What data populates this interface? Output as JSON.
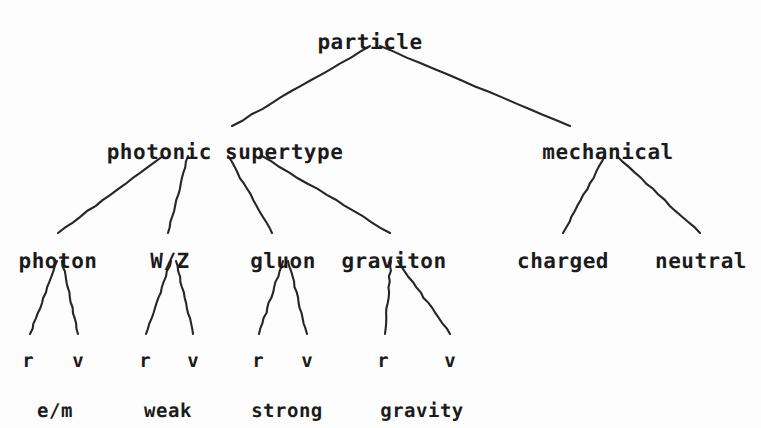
{
  "diagram": {
    "title": "particle",
    "background_color": "#fdfdfd",
    "text_color": "#1b1b1b",
    "line_color": "#262626"
  },
  "nodes": {
    "root": {
      "label": "particle",
      "x": 370,
      "y": 30
    },
    "level2": [
      {
        "label": "photonic supertype",
        "x": 225,
        "y": 140
      },
      {
        "label": "mechanical",
        "x": 608,
        "y": 140
      }
    ],
    "level3": [
      {
        "label": "photon",
        "x": 58,
        "y": 249
      },
      {
        "label": "W/Z",
        "x": 170,
        "y": 249
      },
      {
        "label": "gluon",
        "x": 283,
        "y": 249
      },
      {
        "label": "graviton",
        "x": 394,
        "y": 249
      },
      {
        "label": "charged",
        "x": 563,
        "y": 249
      },
      {
        "label": "neutral",
        "x": 701,
        "y": 249
      }
    ],
    "leaf_symbols": [
      {
        "label": "r",
        "x": 28,
        "y": 350
      },
      {
        "label": "v",
        "x": 78,
        "y": 350
      },
      {
        "label": "r",
        "x": 145,
        "y": 350
      },
      {
        "label": "v",
        "x": 193,
        "y": 350
      },
      {
        "label": "r",
        "x": 258,
        "y": 350
      },
      {
        "label": "v",
        "x": 307,
        "y": 350
      },
      {
        "label": "r",
        "x": 383,
        "y": 350
      },
      {
        "label": "v",
        "x": 450,
        "y": 350
      }
    ],
    "captions": [
      {
        "label": "e/m",
        "x": 55,
        "y": 400
      },
      {
        "label": "weak",
        "x": 168,
        "y": 400
      },
      {
        "label": "strong",
        "x": 287,
        "y": 400
      },
      {
        "label": "gravity",
        "x": 422,
        "y": 400
      }
    ]
  },
  "edges": [
    {
      "from": "particle",
      "to": "photonic supertype",
      "x1": 370,
      "y1": 46,
      "x2": 232,
      "y2": 126
    },
    {
      "from": "particle",
      "to": "mechanical",
      "x1": 380,
      "y1": 46,
      "x2": 570,
      "y2": 126
    },
    {
      "from": "photonic supertype",
      "to": "photon",
      "x1": 163,
      "y1": 156,
      "x2": 58,
      "y2": 233
    },
    {
      "from": "photonic supertype",
      "to": "W/Z",
      "x1": 188,
      "y1": 156,
      "x2": 168,
      "y2": 233
    },
    {
      "from": "photonic supertype",
      "to": "gluon",
      "x1": 228,
      "y1": 156,
      "x2": 272,
      "y2": 233
    },
    {
      "from": "photonic supertype",
      "to": "graviton",
      "x1": 262,
      "y1": 156,
      "x2": 390,
      "y2": 233
    },
    {
      "from": "mechanical",
      "to": "charged",
      "x1": 605,
      "y1": 156,
      "x2": 563,
      "y2": 233
    },
    {
      "from": "mechanical",
      "to": "neutral",
      "x1": 617,
      "y1": 156,
      "x2": 700,
      "y2": 233
    },
    {
      "from": "photon",
      "to": "r",
      "x1": 57,
      "y1": 261,
      "x2": 30,
      "y2": 334
    },
    {
      "from": "photon",
      "to": "v",
      "x1": 62,
      "y1": 261,
      "x2": 78,
      "y2": 334
    },
    {
      "from": "W/Z",
      "to": "r",
      "x1": 171,
      "y1": 261,
      "x2": 146,
      "y2": 334
    },
    {
      "from": "W/Z",
      "to": "v",
      "x1": 176,
      "y1": 261,
      "x2": 193,
      "y2": 334
    },
    {
      "from": "gluon",
      "to": "r",
      "x1": 283,
      "y1": 261,
      "x2": 259,
      "y2": 334
    },
    {
      "from": "gluon",
      "to": "v",
      "x1": 288,
      "y1": 261,
      "x2": 307,
      "y2": 334
    },
    {
      "from": "graviton",
      "to": "r",
      "x1": 391,
      "y1": 261,
      "x2": 385,
      "y2": 334
    },
    {
      "from": "graviton",
      "to": "v",
      "x1": 398,
      "y1": 261,
      "x2": 450,
      "y2": 334
    }
  ]
}
